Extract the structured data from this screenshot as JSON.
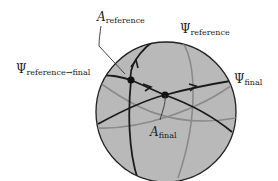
{
  "diagram": {
    "type": "sphere-great-circles",
    "sphere": {
      "cx": 166,
      "cy": 112,
      "r": 70,
      "fill": "#b9b9b9",
      "stroke": "#222222"
    },
    "colors": {
      "front_curve": "#1a1a1a",
      "back_curve": "#8a8a8a",
      "leader": "#333333"
    },
    "labels": {
      "a_reference": {
        "symbol": "A",
        "subscript": "reference"
      },
      "psi_reference": {
        "symbol": "Ψ",
        "subscript": "reference"
      },
      "psi_reference_to_final": {
        "symbol": "Ψ",
        "subscript": "reference→final"
      },
      "psi_final": {
        "symbol": "Ψ",
        "subscript": "final"
      },
      "a_final": {
        "symbol": "A",
        "subscript": "final"
      }
    },
    "points": [
      {
        "name": "A_reference",
        "x": 131,
        "y": 80
      },
      {
        "name": "A_final",
        "x": 165,
        "y": 95
      }
    ]
  }
}
